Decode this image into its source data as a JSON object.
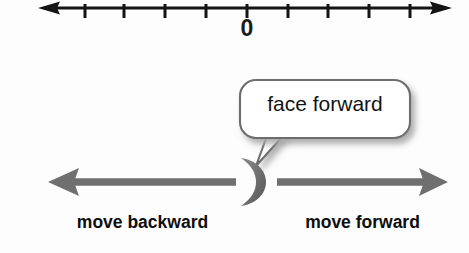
{
  "figure": {
    "background_color": "#fdfdfd"
  },
  "number_line": {
    "label_zero": "0",
    "color": "#151515",
    "axis_y": 8,
    "left_end_x": 38,
    "right_end_x": 452,
    "tick_count": 10,
    "tick_spacing_px": 41,
    "tick_positions_px": [
      85,
      124,
      165,
      206,
      247,
      288,
      328,
      369,
      410,
      443
    ],
    "zero_tick_x": 247,
    "arrowheads": "both"
  },
  "speech_bubble": {
    "text": "face forward",
    "fill_color": "#ffffff",
    "border_color": "#6d6d6d",
    "shadow_color": "#b9b9b9",
    "text_color": "#141414",
    "x": 240,
    "y": 80,
    "width": 170,
    "height": 60,
    "tail_tip_x": 256,
    "tail_tip_y": 166
  },
  "person_marker": {
    "name": "crescent-figure",
    "description": "crescent shape representing a person facing forward (right)",
    "color": "#6b6b6b",
    "center_x": 248,
    "center_y": 182,
    "facing": "right"
  },
  "arrows": [
    {
      "id": "backward-arrow",
      "direction": "left",
      "label": "move backward",
      "color": "#6f6f6f",
      "from_x": 236,
      "to_x": 48,
      "y": 182
    },
    {
      "id": "forward-arrow",
      "direction": "right",
      "label": "move forward",
      "color": "#6f6f6f",
      "from_x": 277,
      "to_x": 448,
      "y": 182
    }
  ],
  "labels": {
    "backward": "move backward",
    "forward": "move forward"
  },
  "colors": {
    "axis": "#151515",
    "arrow_gray": "#6f6f6f",
    "text_dark": "#0e0e0e",
    "bubble_border": "#6d6d6d",
    "bubble_shadow": "#b9b9b9"
  }
}
